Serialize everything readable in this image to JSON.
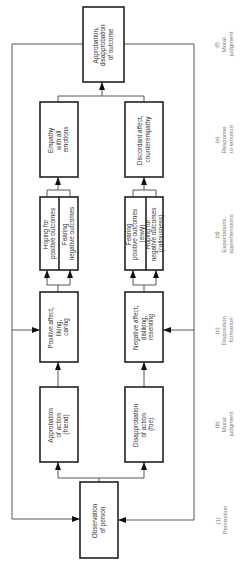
{
  "diagram": {
    "orientation": "rotated-90-ccw",
    "colors": {
      "box_stroke": "#222222",
      "line": "#444444",
      "label_text": "#777777",
      "box_text": "#333333"
    },
    "boxes": {
      "observation": {
        "lines": [
          "Observation",
          "of person"
        ]
      },
      "approbation_action": {
        "lines": [
          "Approbation",
          "of action",
          "(friend)"
        ]
      },
      "disapprobation_action": {
        "lines": [
          "Disapprobation",
          "of action",
          "(foe)"
        ]
      },
      "positive_affect": {
        "lines": [
          "Positive affect,",
          "liking,",
          "caring"
        ]
      },
      "negative_affect": {
        "lines": [
          "Negative affect,",
          "disliking,",
          "resenting"
        ]
      },
      "hoping_positive": {
        "lines": [
          "Hoping for",
          "positive outcomes"
        ]
      },
      "fearing_negative": {
        "lines": [
          "Fearing",
          "negative outcomes"
        ]
      },
      "fearing_positive": {
        "lines": [
          "Fearing",
          "positive outcomes",
          "(envy)"
        ]
      },
      "hoping_negative": {
        "lines": [
          "Hoping for",
          "negative outcomes",
          "(callousness)"
        ]
      },
      "empathy": {
        "lines": [
          "Empathy",
          "with all",
          "emotions"
        ]
      },
      "discordant": {
        "lines": [
          "Discordant affect,",
          "counterempathy"
        ]
      },
      "outcome_judgment": {
        "lines": [
          "Approbation,",
          "disapprobation",
          "of outcome"
        ]
      }
    },
    "stages": [
      {
        "id": "perception",
        "lines": [
          "(1)",
          "Perception"
        ]
      },
      {
        "id": "moral_judgment_b",
        "lines": [
          "(b)",
          "Moral",
          "judgment"
        ]
      },
      {
        "id": "disposition_formation",
        "lines": [
          "(c)",
          "Disposition",
          "formation"
        ]
      },
      {
        "id": "expectations",
        "lines": [
          "(d)",
          "Expectations,",
          "apprehensions"
        ]
      },
      {
        "id": "response_to_emotion",
        "lines": [
          "(e)",
          "Response",
          "to emotion"
        ]
      },
      {
        "id": "moral_judgment_f",
        "lines": [
          "(f)",
          "Moral",
          "judgment"
        ]
      }
    ]
  }
}
